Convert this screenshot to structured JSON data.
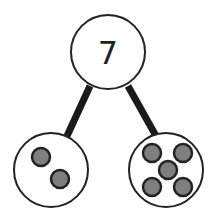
{
  "diagram": {
    "type": "number-bond",
    "whole": {
      "label": "7",
      "cx": 108,
      "cy": 52,
      "r": 37
    },
    "parts": [
      {
        "name": "left",
        "count": 2,
        "cx": 51,
        "cy": 170,
        "r": 37,
        "dots": [
          [
            41,
            157
          ],
          [
            60,
            179
          ]
        ]
      },
      {
        "name": "right",
        "count": 5,
        "cx": 166,
        "cy": 170,
        "r": 37,
        "dots": [
          [
            152,
            153
          ],
          [
            183,
            153
          ],
          [
            168,
            170
          ],
          [
            152,
            187
          ],
          [
            183,
            187
          ]
        ]
      }
    ],
    "colors": {
      "stroke": "#222222",
      "dot_fill": "#7f7f7f",
      "background": "#ffffff"
    }
  }
}
